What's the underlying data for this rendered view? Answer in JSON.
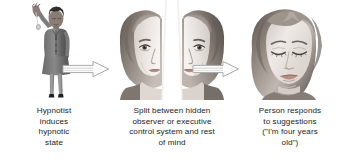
{
  "diagram": {
    "background_color": "#ffffff",
    "text_color": "#232323",
    "arrow_color": "#9a9a9a",
    "panels": [
      {
        "id": "panel-hypnotist",
        "image_name": "hypnotist-with-pendulum",
        "image_description": "Woman in dark suit standing with one arm raised holding a pendulum",
        "caption": "Hypnotist\ninduces\nhypnotic\nstate"
      },
      {
        "id": "panel-split-mind",
        "image_name": "split-face",
        "image_description": "Face split vertically into two mirrored halves separated by a white gap",
        "caption": "Split between hidden\nobserver or executive\ncontrol system and rest\nof mind"
      },
      {
        "id": "panel-response",
        "image_name": "whole-face-eyes-closed",
        "image_description": "Whole face of a woman with eyes closed",
        "caption": "Person responds\nto suggestions\n(\"I'm four years\nold\")"
      }
    ],
    "arrows": [
      {
        "id": "arrow-1",
        "direction": "right"
      },
      {
        "id": "arrow-2",
        "direction": "right"
      }
    ]
  }
}
